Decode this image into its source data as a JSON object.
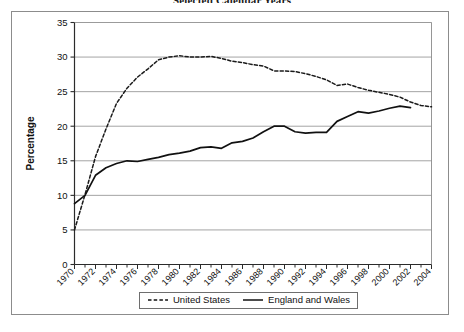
{
  "chart_data": {
    "type": "line",
    "title": "Selected Calendar Years",
    "xlabel": "",
    "ylabel": "Percentage",
    "xlim": [
      1970,
      2004
    ],
    "ylim": [
      0,
      35
    ],
    "yticks": [
      0,
      5,
      10,
      15,
      20,
      25,
      30,
      35
    ],
    "xticks": [
      1970,
      1972,
      1974,
      1976,
      1978,
      1980,
      1982,
      1984,
      1986,
      1988,
      1990,
      1992,
      1994,
      1996,
      1998,
      2000,
      2002,
      2004
    ],
    "x": [
      1970,
      1971,
      1972,
      1973,
      1974,
      1975,
      1976,
      1977,
      1978,
      1979,
      1980,
      1981,
      1982,
      1983,
      1984,
      1985,
      1986,
      1987,
      1988,
      1989,
      1990,
      1991,
      1992,
      1993,
      1994,
      1995,
      1996,
      1997,
      1998,
      1999,
      2000,
      2001,
      2002,
      2003,
      2004
    ],
    "grid": true,
    "grid_axis": "y",
    "legend_position": "bottom",
    "series": [
      {
        "name": "United States",
        "style": "dashed",
        "color": "#1a1a1a",
        "values": [
          5.0,
          10.1,
          15.6,
          19.6,
          23.3,
          25.5,
          27.1,
          28.3,
          29.6,
          30.0,
          30.2,
          30.0,
          30.0,
          30.1,
          29.8,
          29.4,
          29.2,
          28.9,
          28.7,
          28.0,
          28.0,
          27.9,
          27.6,
          27.2,
          26.7,
          25.9,
          26.1,
          25.6,
          25.2,
          24.9,
          24.6,
          24.2,
          23.5,
          23.0,
          22.8
        ]
      },
      {
        "name": "England and Wales",
        "style": "solid",
        "color": "#111111",
        "values": [
          8.8,
          10.0,
          12.9,
          14.0,
          14.6,
          15.0,
          14.9,
          15.2,
          15.5,
          15.9,
          16.1,
          16.4,
          16.9,
          17.0,
          16.8,
          17.6,
          17.8,
          18.3,
          19.2,
          20.0,
          20.0,
          19.2,
          19.0,
          19.1,
          19.1,
          20.7,
          21.4,
          22.1,
          21.9,
          22.2,
          22.6,
          22.9,
          22.7,
          null,
          null
        ]
      }
    ]
  },
  "legend": {
    "items": [
      {
        "label": "United States",
        "style": "dashed"
      },
      {
        "label": "England and Wales",
        "style": "solid"
      }
    ]
  },
  "axis": {
    "y_title": "Percentage"
  }
}
